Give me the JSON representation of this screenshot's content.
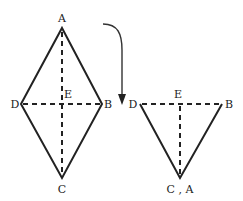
{
  "diagram": {
    "rhombus": {
      "vertices": {
        "A": {
          "label": "A",
          "x": 62,
          "y": 28
        },
        "B": {
          "label": "B",
          "x": 102,
          "y": 104
        },
        "C": {
          "label": "C",
          "x": 62,
          "y": 178
        },
        "D": {
          "label": "D",
          "x": 21,
          "y": 104
        }
      },
      "intersection": {
        "label": "E",
        "x": 62,
        "y": 104
      },
      "solid_edges": [
        "AB",
        "BC",
        "CD",
        "DA"
      ],
      "dashed_lines": [
        "AC",
        "DB"
      ]
    },
    "fold_arrow": {
      "description": "curved arrow indicating folding",
      "from": {
        "x": 103,
        "y": 24
      },
      "to": {
        "x": 122,
        "y": 104
      }
    },
    "folded_triangle": {
      "vertices": {
        "D": {
          "label": "D",
          "x": 140,
          "y": 104
        },
        "B": {
          "label": "B",
          "x": 222,
          "y": 104
        },
        "CA": {
          "label": "C , A",
          "x": 180,
          "y": 178
        }
      },
      "intersection": {
        "label": "E",
        "x": 180,
        "y": 104
      },
      "solid_edges": [
        "D-CA",
        "B-CA"
      ],
      "dashed_lines": [
        "DB",
        "E-CA"
      ]
    }
  }
}
